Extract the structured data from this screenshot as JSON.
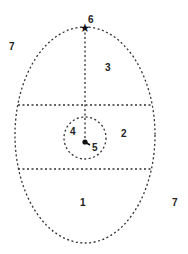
{
  "diagram": {
    "type": "ellipse-zones",
    "colors": {
      "line": "#333333",
      "background": "#ffffff"
    },
    "labels": [
      {
        "id": "1",
        "text": "1",
        "x": 80,
        "y": 198
      },
      {
        "id": "2",
        "text": "2",
        "x": 121,
        "y": 129
      },
      {
        "id": "3",
        "text": "3",
        "x": 105,
        "y": 63
      },
      {
        "id": "4",
        "text": "4",
        "x": 70,
        "y": 127
      },
      {
        "id": "5",
        "text": "5",
        "x": 92,
        "y": 143
      },
      {
        "id": "6",
        "text": "6",
        "x": 88,
        "y": 15
      },
      {
        "id": "7a",
        "text": "7",
        "x": 9,
        "y": 42
      },
      {
        "id": "7b",
        "text": "7",
        "x": 172,
        "y": 198
      }
    ],
    "markers": {
      "star": "★",
      "dot": "●"
    }
  }
}
